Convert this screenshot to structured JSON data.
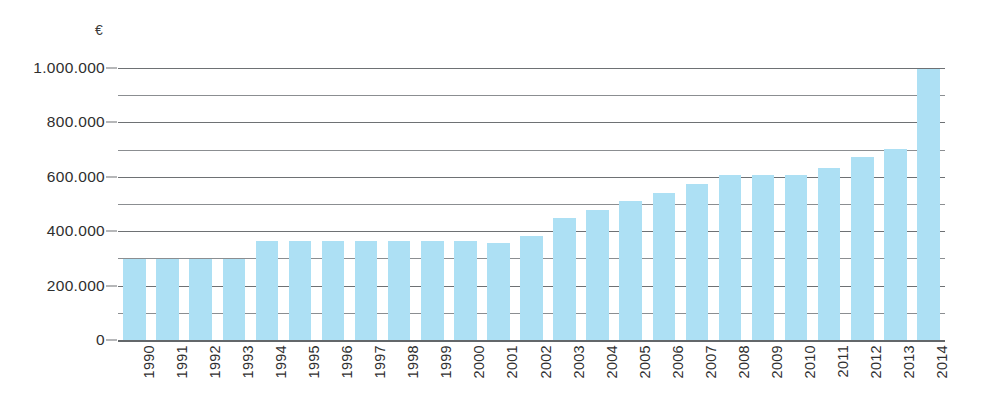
{
  "chart_data": {
    "type": "bar",
    "title": "",
    "subtitle": "",
    "xlabel": "",
    "ylabel": "€",
    "unit_symbol": "€",
    "categories": [
      "1990",
      "1991",
      "1992",
      "1993",
      "1994",
      "1995",
      "1996",
      "1997",
      "1998",
      "1999",
      "2000",
      "2001",
      "2002",
      "2003",
      "2004",
      "2005",
      "2006",
      "2007",
      "2008",
      "2009",
      "2010",
      "2011",
      "2012",
      "2013",
      "2014"
    ],
    "values": [
      297000,
      297000,
      297000,
      297000,
      365000,
      365000,
      365000,
      365000,
      365000,
      365000,
      365000,
      358000,
      383000,
      448000,
      478000,
      510000,
      542000,
      575000,
      605000,
      605000,
      605000,
      632000,
      672000,
      703000,
      995000
    ],
    "ylim": [
      0,
      1000000
    ],
    "y_tick_labels": [
      "1.000.000",
      "800.000",
      "600.000",
      "400.000",
      "200.000",
      "0"
    ],
    "y_tick_values": [
      1000000,
      800000,
      600000,
      400000,
      200000,
      0
    ],
    "y_minor_tick_values": [
      900000,
      700000,
      500000,
      300000,
      100000
    ],
    "grid": true,
    "legend": false,
    "legend_position": "none",
    "bar_color": "#ade0f4",
    "gridline_color": "#6e7174",
    "axis_text_color": "#2f2f2f",
    "background_color": "#ffffff",
    "x_label_rotation": -90
  }
}
